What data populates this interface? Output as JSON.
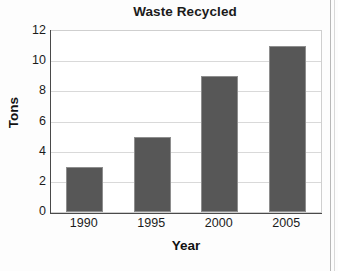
{
  "chart_data": {
    "type": "bar",
    "title": "Waste Recycled",
    "xlabel": "Year",
    "ylabel": "Tons",
    "categories": [
      "1990",
      "1995",
      "2000",
      "2005"
    ],
    "values": [
      3,
      5,
      9,
      11
    ],
    "ylim": [
      0,
      12
    ],
    "ytick_step": 2,
    "yticks": [
      "0",
      "2",
      "4",
      "6",
      "8",
      "10",
      "12"
    ],
    "grid": true,
    "legend": "none",
    "bar_color": "#575757",
    "bar_edge_color": "#8e8e8e",
    "gridline_color": "#d9d9d9",
    "axis_color": "#4a4a4a",
    "plot_background": "#ffffff",
    "figure_background": "#fdfdfd"
  }
}
